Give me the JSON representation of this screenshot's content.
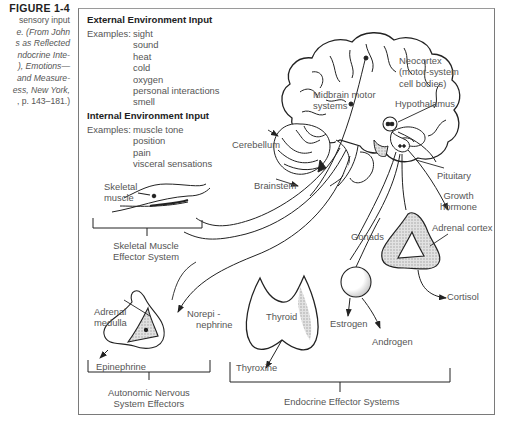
{
  "caption": {
    "figure_label": "FIGURE 1-4",
    "lines": [
      "sensory input",
      "e. (From John",
      "s as Reflected",
      "ndocrine Inte-",
      "), Emotions—",
      "and Measure-",
      "ess, New York,",
      ", p. 143–181.)"
    ]
  },
  "external_input": {
    "heading": "External Environment Input",
    "examples_label": "Examples:",
    "items": [
      "sight",
      "sound",
      "heat",
      "cold",
      "oxygen",
      "personal interactions",
      "smell"
    ]
  },
  "internal_input": {
    "heading": "Internal Environment Input",
    "examples_label": "Examples:",
    "items": [
      "muscle tone",
      "position",
      "pain",
      "visceral sensations"
    ]
  },
  "labels": {
    "neocortex": [
      "Neocortex",
      "(motor-system",
      "cell bodies)"
    ],
    "midbrain": [
      "Midbrain motor",
      "systems"
    ],
    "hypothalamus": "Hypothalamus",
    "cerebellum": "Cerebellum",
    "brainstem": "Brainstem",
    "pituitary": "Pituitary",
    "growth_hormone": [
      "Growth",
      "hormone"
    ],
    "skeletal_muscle": [
      "Skeletal",
      "muscle"
    ],
    "skeletal_system": [
      "Skeletal Muscle",
      "Effector System"
    ],
    "gonads": "Gonads",
    "adrenal_cortex": "Adrenal cortex",
    "cortisol": "Cortisol",
    "adrenal_medulla": [
      "Adrenal",
      "medulla"
    ],
    "norepinephrine": [
      "Norepi -",
      "nephrine"
    ],
    "thyroid": "Thyroid",
    "estrogen": "Estrogen",
    "androgen": "Androgen",
    "epinephrine": "Epinephrine",
    "thyroxine": "Thyroxine",
    "autonomic": [
      "Autonomic Nervous",
      "System Effectors"
    ],
    "endocrine": "Endocrine Effector Systems"
  },
  "colors": {
    "line": "#2a2a2a",
    "shade": "#c9c9c9",
    "frame": "#7a7a7a"
  }
}
